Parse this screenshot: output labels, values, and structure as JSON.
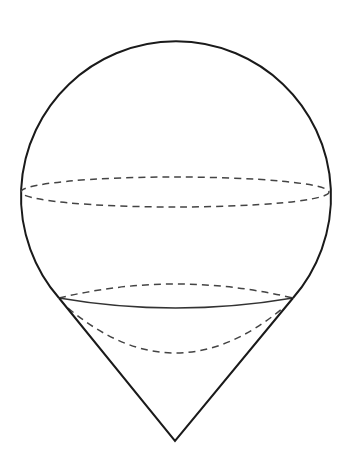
{
  "diagram": {
    "background": "#ffffff",
    "stroke_color": "#1a1a1a",
    "dash_color": "#444444",
    "sphere": {
      "cx": 175,
      "cy": 190,
      "r": 155
    },
    "equator": {
      "cx": 175,
      "cy": 192,
      "rx": 154,
      "ry": 15
    },
    "tangent_circle": {
      "left_x": 59,
      "right_x": 293,
      "y": 298,
      "front_sag_y": 308,
      "back_top_y": 284
    },
    "inner_cap_arc": {
      "bottom_y": 353
    },
    "cone": {
      "apex_x": 175,
      "apex_y": 441
    }
  }
}
